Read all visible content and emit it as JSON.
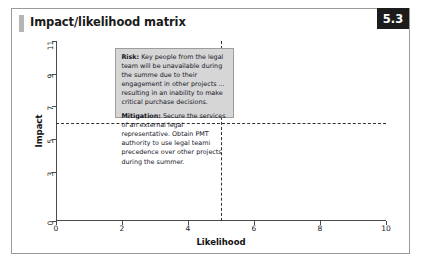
{
  "figure": {
    "title": "Impact/likelihood matrix",
    "badge": "5.3"
  },
  "chart_data": {
    "type": "scatter",
    "title": "Impact/likelihood matrix",
    "xlabel": "Likelihood",
    "ylabel": "Impact",
    "xlim": [
      0,
      10
    ],
    "ylim": [
      0,
      11
    ],
    "xticks": [
      0,
      2,
      4,
      6,
      8,
      10
    ],
    "xtick_labels": [
      "0",
      "2",
      "4",
      "6",
      "8",
      "10"
    ],
    "yticks": [
      0,
      3,
      5,
      7,
      9,
      11
    ],
    "ytick_labels": [
      "0",
      "3",
      "5",
      "7",
      "9",
      "11"
    ],
    "grid": false,
    "legend": false,
    "threshold_lines": [
      {
        "name": "likelihood-threshold",
        "orientation": "vertical",
        "value": 5,
        "style": "dashed",
        "from": 0,
        "to": 11
      },
      {
        "name": "impact-threshold",
        "orientation": "horizontal",
        "value": 6,
        "style": "dashed",
        "from": 0,
        "to": 10
      }
    ],
    "annotations": [
      {
        "name": "risk-mitigation-callout",
        "x_range": [
          1.8,
          5.4
        ],
        "y_range": [
          6.3,
          10.6
        ],
        "risk_label": "Risk:",
        "risk_text": "Key people from the legal team will be unavailable during the summe due to their engagement in other projects ... resulting in an inability to make critical purchase decisions.",
        "mitigation_label": "Mitigation:",
        "mitigation_text": "Secure the services of an external legal representative. Obtain PMT authority to use legal teami precedence over other projects during the summer."
      }
    ]
  },
  "colors": {
    "badge_bg": "#1c1c1c",
    "badge_text": "#ffffff",
    "frame_border": "#9a9a9a",
    "axis": "#4a4a4a",
    "callout_bg": "#d6d6d6",
    "callout_border": "#9d9d9d",
    "title_bar": "#b5b5b5"
  }
}
